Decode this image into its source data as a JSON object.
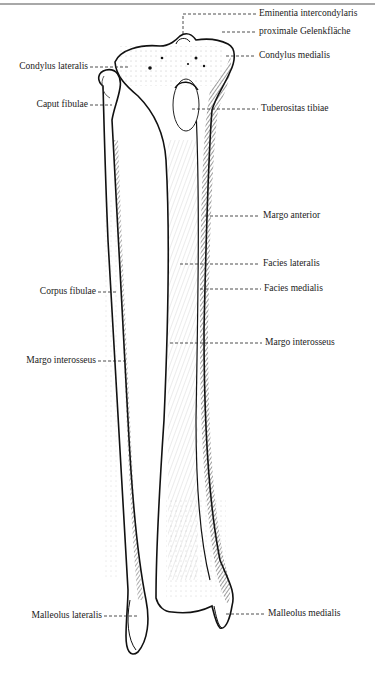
{
  "figure": {
    "colors": {
      "ink": "#1a1a1a",
      "rule": "#a8a8a8",
      "background": "#ffffff"
    }
  },
  "labels": {
    "right": [
      {
        "id": "eminentia",
        "text": "Eminentia intercondylaris",
        "x": 259,
        "y": 8
      },
      {
        "id": "gelenkflaeche",
        "text": "proximale Gelenkfläche",
        "x": 259,
        "y": 26
      },
      {
        "id": "condylus_medialis",
        "text": "Condylus medialis",
        "x": 259,
        "y": 50
      },
      {
        "id": "tuberositas",
        "text": "Tuberositas tibiae",
        "x": 261,
        "y": 103
      },
      {
        "id": "margo_anterior",
        "text": "Margo anterior",
        "x": 263,
        "y": 210
      },
      {
        "id": "facies_lateralis",
        "text": "Facies lateralis",
        "x": 263,
        "y": 258
      },
      {
        "id": "facies_medialis",
        "text": "Facies medialis",
        "x": 264,
        "y": 283
      },
      {
        "id": "margo_interosseus_r",
        "text": "Margo interosseus",
        "x": 265,
        "y": 337
      },
      {
        "id": "malleolus_medialis",
        "text": "Malleolus medialis",
        "x": 268,
        "y": 608
      }
    ],
    "left": [
      {
        "id": "condylus_lateralis",
        "text": "Condylus lateralis",
        "right": 88,
        "y": 61
      },
      {
        "id": "caput_fibulae",
        "text": "Caput fibulae",
        "right": 88,
        "y": 99
      },
      {
        "id": "corpus_fibulae",
        "text": "Corpus fibulae",
        "right": 96,
        "y": 286
      },
      {
        "id": "margo_interosseus_l",
        "text": "Margo interosseus",
        "right": 96,
        "y": 355
      },
      {
        "id": "malleolus_lateralis",
        "text": "Malleolus lateralis",
        "right": 102,
        "y": 610
      }
    ]
  }
}
